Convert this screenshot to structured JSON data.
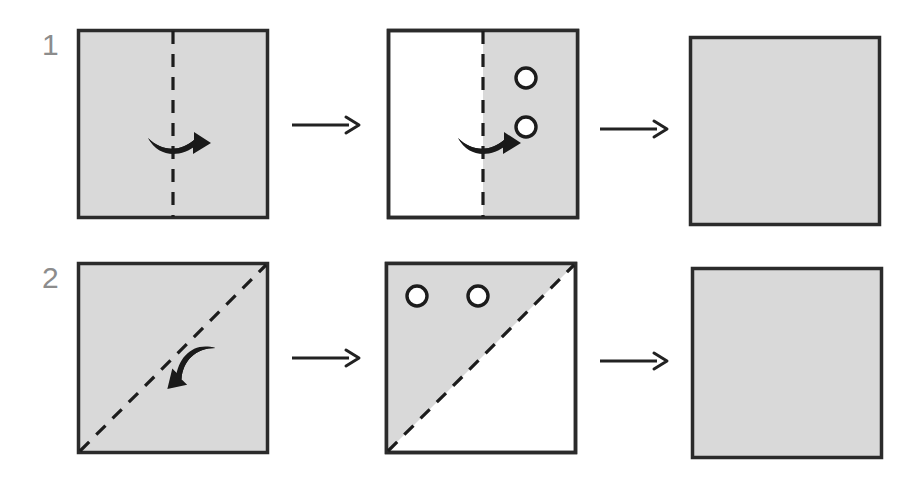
{
  "figure": {
    "type": "paper-folding-punch-puzzle",
    "background_color": "#ffffff",
    "paper_fill_color": "#d9d9d9",
    "paper_edge_color": "#2b2b2b",
    "fold_line_color": "#1c1c1c",
    "hole_outline_color": "#1c1c1c",
    "hole_fill_color": "#ffffff",
    "arrow_color": "#1a1a1a",
    "label_color": "#8c8c8c"
  },
  "rows": [
    {
      "label": "1",
      "label_name": "row-number-1",
      "fold_type": "vertical",
      "steps": [
        {
          "name": "unfolded-square-with-vertical-fold-line",
          "shape": "square",
          "fill": "full",
          "fold_line": "vertical-center-dashed",
          "fold_arrow": "curved-arrow-pointing-right",
          "holes": []
        },
        {
          "name": "folded-right-half-with-two-holes",
          "shape": "square",
          "fill": "right-half",
          "fold_line": "vertical-center-dashed",
          "fold_arrow": "curved-arrow-pointing-right",
          "holes": [
            {
              "cx_pct": 72,
              "cy_pct": 26,
              "r_pct": 4.8
            },
            {
              "cx_pct": 72,
              "cy_pct": 52,
              "r_pct": 4.8
            }
          ]
        },
        {
          "name": "answer-blank-square",
          "shape": "square",
          "fill": "full",
          "fold_line": "none",
          "fold_arrow": "none",
          "holes": []
        }
      ],
      "connectors": [
        "straight-arrow-right",
        "straight-arrow-right"
      ]
    },
    {
      "label": "2",
      "label_name": "row-number-2",
      "fold_type": "diagonal",
      "steps": [
        {
          "name": "unfolded-square-with-diagonal-fold-line",
          "shape": "square",
          "fill": "full",
          "fold_line": "diagonal-bottomleft-to-topright-dashed",
          "fold_arrow": "curved-arrow-pointing-up-left",
          "holes": []
        },
        {
          "name": "folded-upper-left-triangle-with-two-holes",
          "shape": "square",
          "fill": "upper-left-triangle",
          "fold_line": "diagonal-bottomleft-to-topright-dashed",
          "fold_arrow": "none",
          "holes": [
            {
              "cx_pct": 17,
              "cy_pct": 18,
              "r_pct": 4.8
            },
            {
              "cx_pct": 49,
              "cy_pct": 18,
              "r_pct": 4.8
            }
          ]
        },
        {
          "name": "answer-blank-square",
          "shape": "square",
          "fill": "full",
          "fold_line": "none",
          "fold_arrow": "none",
          "holes": []
        }
      ],
      "connectors": [
        "straight-arrow-right",
        "straight-arrow-right"
      ]
    }
  ]
}
